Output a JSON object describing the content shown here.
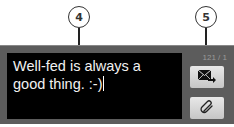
{
  "callouts": [
    {
      "number": "4",
      "target": "message-text-field"
    },
    {
      "number": "5",
      "target": "send-button"
    }
  ],
  "composer": {
    "message_text": "Well-fed is always a good thing. :-)",
    "char_counter": "121 / 1"
  },
  "buttons": {
    "send": {
      "icon": "send-message-icon"
    },
    "attach": {
      "icon": "paperclip-icon"
    }
  },
  "colors": {
    "panel_bg": "#5c5c5c",
    "text_field_bg": "#000000",
    "text_color": "#f2f2f2",
    "button_bg": "#d6d6d6"
  }
}
